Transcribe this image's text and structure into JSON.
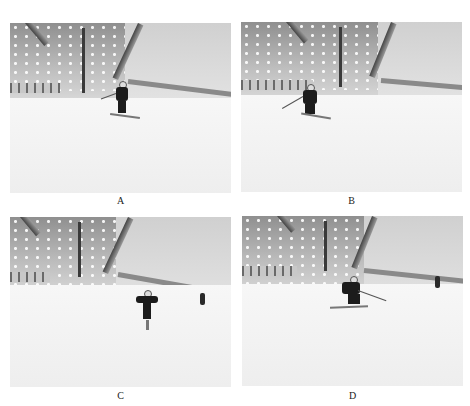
{
  "figure": {
    "panels": [
      {
        "id": "A",
        "label": "A",
        "description": "Indoor ski slope, skier in black descending center with poles, skis angled"
      },
      {
        "id": "B",
        "label": "B",
        "description": "Indoor ski slope, skier in black turning left, pole extended to left"
      },
      {
        "id": "C",
        "label": "C",
        "description": "Indoor ski slope, skier in black with arms out, person standing at right near fence"
      },
      {
        "id": "D",
        "label": "D",
        "description": "Indoor ski slope, skier in black crouched turning, pole extended right, person at right"
      }
    ]
  }
}
